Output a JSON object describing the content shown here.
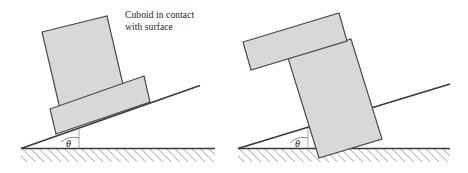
{
  "figure": {
    "type": "physics-inclined-plane-diagram",
    "panel_count": 2,
    "background_color": "#ffffff",
    "block_fill_color": "#d8d8d8",
    "block_stroke_color": "#4a4a4a",
    "line_color": "#3a3a3a",
    "hatch_color": "#6e6e6e"
  },
  "panels": [
    {
      "id": "left",
      "caption": "Cuboid in contact\nwith surface",
      "angle_label": "θ",
      "object_name": "cuboid",
      "shapes": [
        {
          "name": "upper-cuboid-block",
          "role": "tilted tall rectangle resting on base block"
        },
        {
          "name": "lower-base-block",
          "role": "wide flat rectangle contacting incline surface"
        }
      ],
      "incline": {
        "name": "incline-surface",
        "rises_to": "right"
      },
      "ground": {
        "name": "ground-hatched-band"
      }
    },
    {
      "id": "right",
      "caption": "Cylinder in contact\nwith surface",
      "angle_label": "θ",
      "object_name": "cylinder",
      "shapes": [
        {
          "name": "upper-flat-block",
          "role": "wide flat tilted rectangle on top"
        },
        {
          "name": "lower-cylinder-block",
          "role": "tall rectangle contacting incline surface"
        }
      ],
      "incline": {
        "name": "incline-surface",
        "rises_to": "right"
      },
      "ground": {
        "name": "ground-hatched-band"
      }
    }
  ]
}
